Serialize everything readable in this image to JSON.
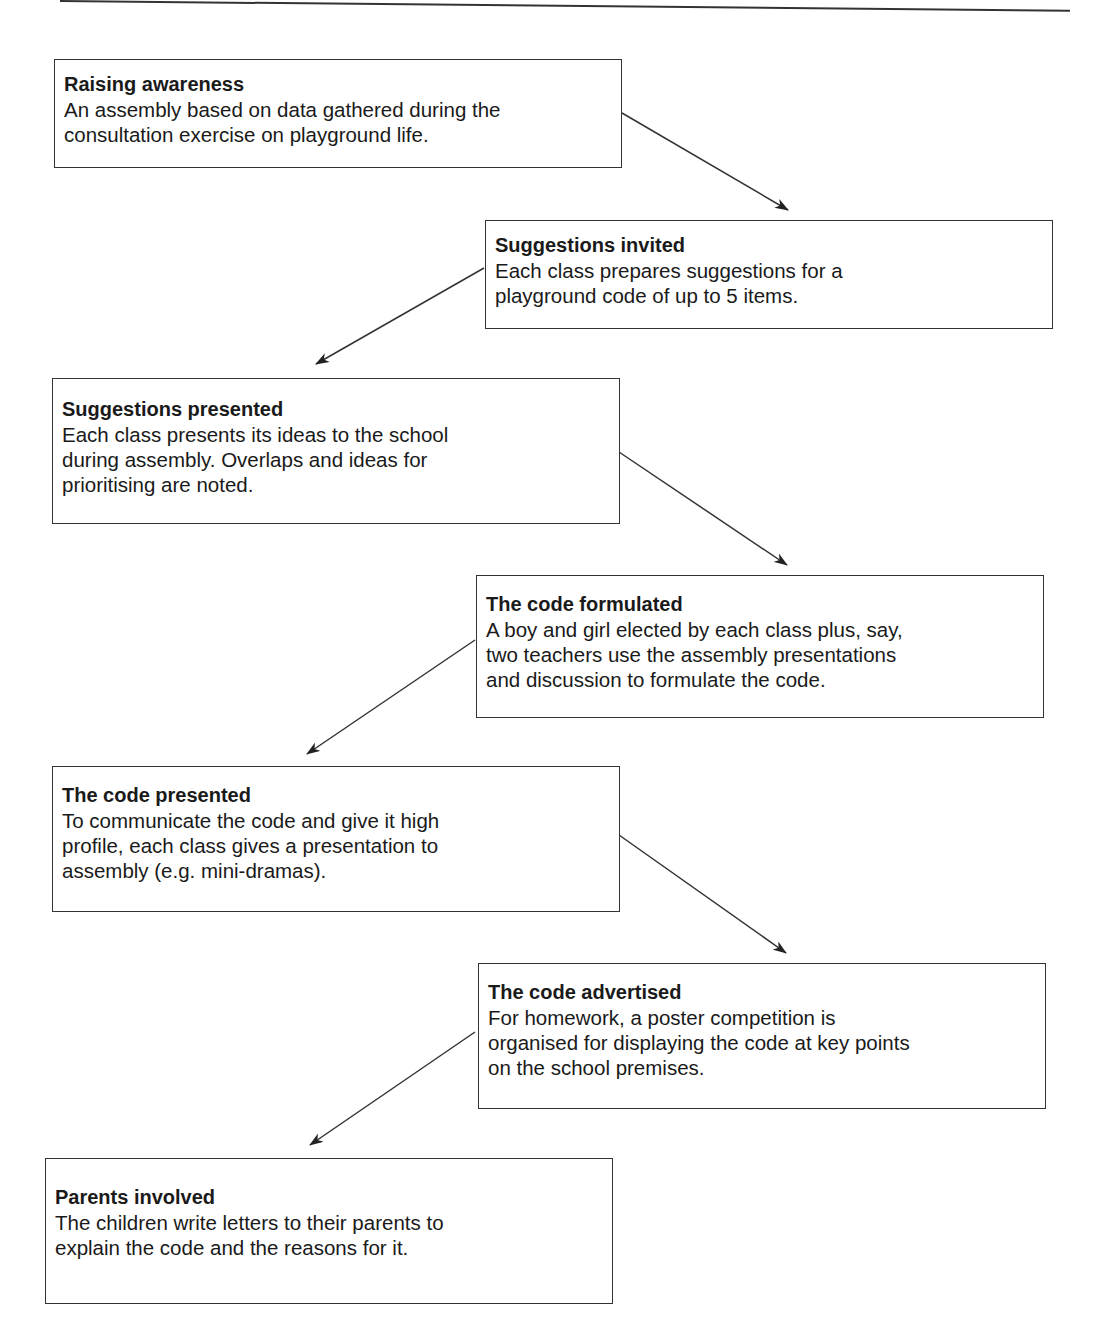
{
  "page": {
    "header_rule": true,
    "page_number": "121"
  },
  "steps": [
    {
      "id": "raising-awareness",
      "title": "Raising awareness",
      "body": "An assembly based on data gathered during the\nconsultation exercise on playground life."
    },
    {
      "id": "suggestions-invited",
      "title": "Suggestions invited",
      "body": "Each class prepares suggestions for a\nplayground code of up to 5 items."
    },
    {
      "id": "suggestions-presented",
      "title": "Suggestions presented",
      "body": "Each class presents its ideas to the school\nduring assembly. Overlaps and ideas for\nprioritising are noted."
    },
    {
      "id": "code-formulated",
      "title": "The code formulated",
      "body": "A boy and girl elected by each class plus, say,\ntwo teachers use the assembly presentations\nand discussion to formulate the code."
    },
    {
      "id": "code-presented",
      "title": "The code presented",
      "body": "To communicate the code and give it high\nprofile, each class gives a presentation to\nassembly (e.g. mini-dramas)."
    },
    {
      "id": "code-advertised",
      "title": "The code advertised",
      "body": "For homework, a poster competition is\norganised for displaying the code at key points\non the school premises."
    },
    {
      "id": "parents-involved",
      "title": "Parents involved",
      "body": "The children write letters to their parents to\nexplain the code and the reasons for it."
    }
  ],
  "arrows": [
    {
      "from": "raising-awareness",
      "to": "suggestions-invited",
      "direction": "down-right"
    },
    {
      "from": "suggestions-invited",
      "to": "suggestions-presented",
      "direction": "down-left"
    },
    {
      "from": "suggestions-presented",
      "to": "code-formulated",
      "direction": "down-right"
    },
    {
      "from": "code-formulated",
      "to": "code-presented",
      "direction": "down-left"
    },
    {
      "from": "code-presented",
      "to": "code-advertised",
      "direction": "down-right"
    },
    {
      "from": "code-advertised",
      "to": "parents-involved",
      "direction": "down-left"
    }
  ]
}
